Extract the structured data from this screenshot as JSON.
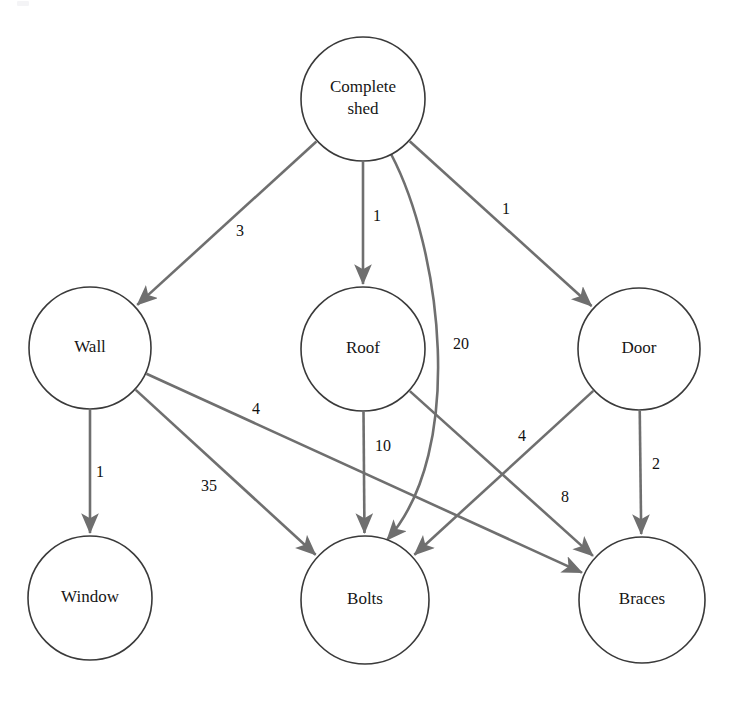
{
  "diagram": {
    "type": "directed-graph",
    "colors": {
      "node_stroke": "#3a3a3a",
      "node_fill": "#ffffff",
      "edge_stroke": "#6f6f6f",
      "label_text": "#111111",
      "background": "#ffffff"
    },
    "nodes": [
      {
        "id": "complete-shed",
        "label": "Complete shed",
        "label_lines": [
          "Complete",
          "shed"
        ],
        "cx": 363,
        "cy": 99,
        "r": 62
      },
      {
        "id": "wall",
        "label": "Wall",
        "label_lines": [
          "Wall"
        ],
        "cx": 90,
        "cy": 348,
        "r": 61
      },
      {
        "id": "roof",
        "label": "Roof",
        "label_lines": [
          "Roof"
        ],
        "cx": 363,
        "cy": 349,
        "r": 62
      },
      {
        "id": "door",
        "label": "Door",
        "label_lines": [
          "Door"
        ],
        "cx": 639,
        "cy": 349,
        "r": 61
      },
      {
        "id": "window",
        "label": "Window",
        "label_lines": [
          "Window"
        ],
        "cx": 90,
        "cy": 598,
        "r": 62
      },
      {
        "id": "bolts",
        "label": "Bolts",
        "label_lines": [
          "Bolts"
        ],
        "cx": 365,
        "cy": 600,
        "r": 64
      },
      {
        "id": "braces",
        "label": "Braces",
        "label_lines": [
          "Braces"
        ],
        "cx": 642,
        "cy": 600,
        "r": 63
      }
    ],
    "edges": [
      {
        "id": "shed-wall",
        "from": "complete-shed",
        "to": "wall",
        "quantity": "3",
        "label_x": 240,
        "label_y": 232,
        "shape": "straight"
      },
      {
        "id": "shed-roof",
        "from": "complete-shed",
        "to": "roof",
        "quantity": "1",
        "label_x": 377,
        "label_y": 217,
        "shape": "straight"
      },
      {
        "id": "shed-door",
        "from": "complete-shed",
        "to": "door",
        "quantity": "1",
        "label_x": 506,
        "label_y": 210,
        "shape": "straight"
      },
      {
        "id": "shed-bolts",
        "from": "complete-shed",
        "to": "bolts",
        "quantity": "20",
        "label_x": 461,
        "label_y": 345,
        "shape": "curved"
      },
      {
        "id": "wall-window",
        "from": "wall",
        "to": "window",
        "quantity": "1",
        "label_x": 100,
        "label_y": 473,
        "shape": "straight"
      },
      {
        "id": "wall-braces",
        "from": "wall",
        "to": "braces",
        "quantity": "4",
        "label_x": 256,
        "label_y": 410,
        "shape": "straight"
      },
      {
        "id": "wall-bolts",
        "from": "wall",
        "to": "bolts",
        "quantity": "35",
        "label_x": 209,
        "label_y": 487,
        "shape": "straight"
      },
      {
        "id": "roof-bolts",
        "from": "roof",
        "to": "bolts",
        "quantity": "10",
        "label_x": 383,
        "label_y": 447,
        "shape": "straight"
      },
      {
        "id": "roof-braces",
        "from": "roof",
        "to": "braces",
        "quantity": "8",
        "label_x": 565,
        "label_y": 498,
        "shape": "straight"
      },
      {
        "id": "door-bolts",
        "from": "door",
        "to": "bolts",
        "quantity": "4",
        "label_x": 522,
        "label_y": 437,
        "shape": "straight"
      },
      {
        "id": "door-braces",
        "from": "door",
        "to": "braces",
        "quantity": "2",
        "label_x": 656,
        "label_y": 465,
        "shape": "straight"
      }
    ]
  }
}
